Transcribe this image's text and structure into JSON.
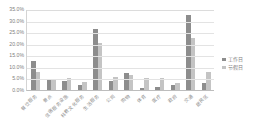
{
  "chart_data": {
    "type": "bar",
    "title": "",
    "xlabel": "",
    "ylabel": "",
    "ylim": [
      0,
      0.35
    ],
    "grid": true,
    "legend_position": "right",
    "ytick_labels": [
      "35.0%",
      "30.0%",
      "25.0%",
      "20.0%",
      "15.0%",
      "10.0%",
      "5.0%",
      "0.0%"
    ],
    "ytick_values": [
      35.0,
      30.0,
      25.0,
      20.0,
      15.0,
      10.0,
      5.0,
      0.0
    ],
    "categories": [
      "餐饮服务",
      "景点",
      "住宿服务设施",
      "科教文化服务",
      "生活服务",
      "公司",
      "购物",
      "体育",
      "医疗",
      "政府",
      "交通",
      "居民区"
    ],
    "series": [
      {
        "name": "工作日",
        "color": "#8d8d8d",
        "values": [
          12.5,
          4.6,
          3.9,
          2.1,
          26.5,
          4.0,
          7.2,
          0.9,
          1.1,
          2.2,
          32.2,
          2.9
        ]
      },
      {
        "name": "节假日",
        "color": "#c4c4c4",
        "values": [
          7.9,
          4.8,
          5.1,
          3.3,
          20.2,
          5.5,
          6.3,
          5.0,
          5.0,
          3.2,
          22.6,
          8.0
        ]
      }
    ]
  },
  "legend": {
    "items": [
      {
        "label": "工作日",
        "color": "#8d8d8d"
      },
      {
        "label": "节假日",
        "color": "#c4c4c4"
      }
    ]
  },
  "header": {
    "title": ""
  }
}
